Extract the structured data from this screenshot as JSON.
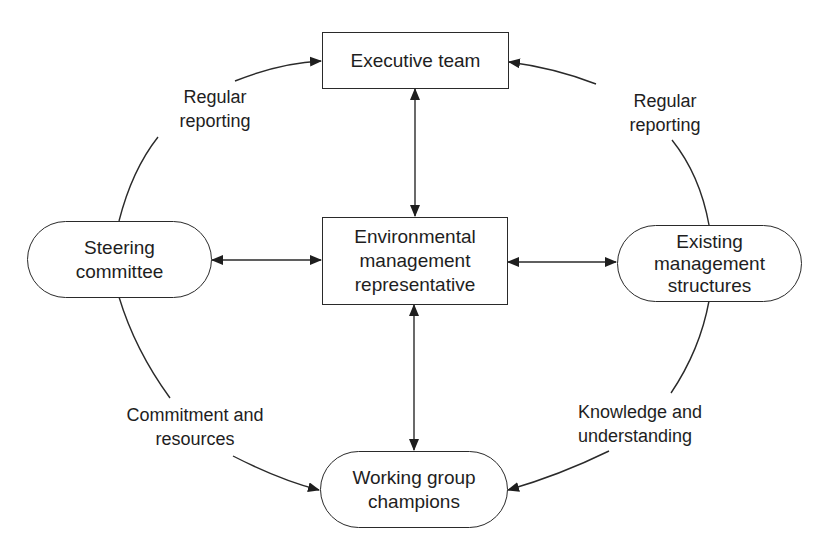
{
  "diagram": {
    "nodes": {
      "executive_team": {
        "shape": "rectangle",
        "lines": [
          "Executive team"
        ]
      },
      "env_rep": {
        "shape": "rectangle",
        "lines": [
          "Environmental",
          "management",
          "representative"
        ]
      },
      "steering": {
        "shape": "rounded",
        "lines": [
          "Steering",
          "committee"
        ]
      },
      "existing": {
        "shape": "rounded",
        "lines": [
          "Existing",
          "management",
          "structures"
        ]
      },
      "working": {
        "shape": "rounded",
        "lines": [
          "Working group",
          "champions"
        ]
      }
    },
    "edge_labels": {
      "top_left": [
        "Regular",
        "reporting"
      ],
      "top_right": [
        "Regular",
        "reporting"
      ],
      "bottom_left": [
        "Commitment and",
        "resources"
      ],
      "bottom_right": [
        "Knowledge and",
        "understanding"
      ]
    },
    "edges": [
      {
        "from": "Steering committee",
        "to": "Executive team",
        "label": "Regular reporting",
        "type": "curved-arrow"
      },
      {
        "from": "Existing management structures",
        "to": "Executive team",
        "label": "Regular reporting",
        "type": "curved-arrow"
      },
      {
        "from": "Steering committee",
        "to": "Working group champions",
        "label": "Commitment and resources",
        "type": "curved-arrow"
      },
      {
        "from": "Existing management structures",
        "to": "Working group champions",
        "label": "Knowledge and understanding",
        "type": "curved-arrow"
      },
      {
        "from": "Executive team",
        "to": "Environmental management representative",
        "type": "double-arrow"
      },
      {
        "from": "Steering committee",
        "to": "Environmental management representative",
        "type": "double-arrow"
      },
      {
        "from": "Environmental management representative",
        "to": "Existing management structures",
        "type": "double-arrow"
      },
      {
        "from": "Environmental management representative",
        "to": "Working group champions",
        "type": "double-arrow"
      }
    ],
    "colors": {
      "stroke": "#2a2a2a",
      "text": "#1e1e1e",
      "background": "#ffffff"
    }
  }
}
